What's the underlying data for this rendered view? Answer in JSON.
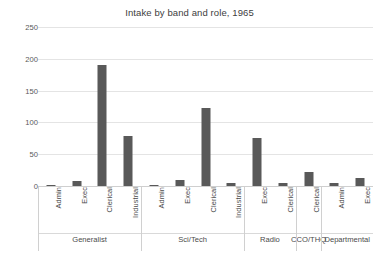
{
  "chart_data": {
    "type": "bar",
    "title": "Intake by band and role, 1965",
    "xlabel": "",
    "ylabel": "",
    "ylim": [
      0,
      250
    ],
    "yticks": [
      0,
      50,
      100,
      150,
      200,
      250
    ],
    "grid": true,
    "legend": "none",
    "bar_color": "#595959",
    "groups": [
      {
        "name": "Generalist",
        "categories": [
          "Admin",
          "Exec",
          "Clerical",
          "Industrial"
        ],
        "values": [
          1,
          8,
          190,
          78
        ]
      },
      {
        "name": "Sci/Tech",
        "categories": [
          "Admin",
          "Exec",
          "Clerical",
          "Industrial"
        ],
        "values": [
          1,
          10,
          122,
          4
        ]
      },
      {
        "name": "Radio",
        "categories": [
          "Exec",
          "Clerical"
        ],
        "values": [
          75,
          4
        ]
      },
      {
        "name": "CCO/THQ",
        "categories": [
          "Clerical"
        ],
        "values": [
          22
        ]
      },
      {
        "name": "Departmental",
        "categories": [
          "Admin",
          "Exec"
        ],
        "values": [
          4,
          13
        ]
      }
    ],
    "categories": [
      "Admin",
      "Exec",
      "Clerical",
      "Industrial",
      "Admin",
      "Exec",
      "Clerical",
      "Industrial",
      "Exec",
      "Clerical",
      "Clerical",
      "Admin",
      "Exec"
    ],
    "values": [
      1,
      8,
      190,
      78,
      1,
      10,
      122,
      4,
      75,
      4,
      22,
      4,
      13
    ]
  }
}
